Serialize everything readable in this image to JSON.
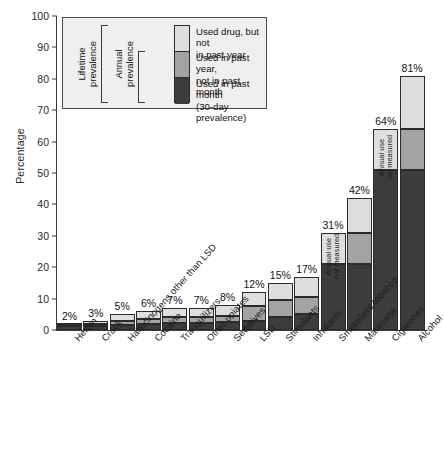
{
  "chart_data": {
    "type": "bar",
    "stacked": true,
    "title": "",
    "xlabel": "",
    "ylabel": "Percentage",
    "ylim": [
      0,
      100
    ],
    "yticks": [
      0,
      10,
      20,
      30,
      40,
      50,
      60,
      70,
      80,
      90,
      100
    ],
    "grid": false,
    "legend_position": "top-left inside plot area",
    "categories": [
      "Heroin",
      "Crack",
      "Hallucinogens other than LSD",
      "Cocaine",
      "Tranquilizers",
      "Other opiates",
      "Sedatives",
      "LSD",
      "Stimulants",
      "Inhalants",
      "Smokeless tobacco",
      "Marijuana",
      "Cigarettes",
      "Alcohol"
    ],
    "series": [
      {
        "name": "Used in past month (30-day prevalence)",
        "color": "#3c3c3c",
        "values": [
          1.4,
          1.2,
          1.5,
          2.0,
          2.2,
          2.2,
          2.4,
          3.0,
          4.0,
          5.0,
          21.0,
          21.0,
          51.0,
          51.0
        ]
      },
      {
        "name": "Used in past year, not in past month",
        "color": "#a3a3a3",
        "values": [
          0.3,
          0.6,
          1.3,
          1.6,
          2.0,
          2.0,
          2.1,
          4.5,
          5.5,
          5.5,
          null,
          10.0,
          null,
          13.0
        ]
      },
      {
        "name": "Used drug, but not in past year",
        "color": "#dedede",
        "values": [
          0.3,
          1.2,
          2.2,
          2.4,
          2.8,
          2.8,
          3.5,
          4.5,
          5.5,
          6.5,
          10.0,
          11.0,
          13.0,
          17.0
        ]
      }
    ],
    "totals": [
      2,
      3,
      5,
      6,
      7,
      7,
      8,
      12,
      15,
      17,
      31,
      42,
      64,
      81
    ],
    "data_labels": [
      "2%",
      "3%",
      "5%",
      "6%",
      "7%",
      "7%",
      "8%",
      "12%",
      "15%",
      "17%",
      "31%",
      "42%",
      "64%",
      "81%"
    ],
    "annotations": [
      {
        "category": "Smokeless tobacco",
        "text": "Annual use not measured"
      },
      {
        "category": "Cigarettes",
        "text": "Annual use not measured"
      }
    ]
  },
  "axis": {
    "y_title": "Percentage",
    "y_ticks": [
      "100",
      "90",
      "80",
      "70",
      "60",
      "50",
      "40",
      "30",
      "20",
      "10",
      "0"
    ]
  },
  "legend": {
    "items": [
      {
        "key": "lifetime-only",
        "label_line1": "Used drug, but not",
        "label_line2": "in past year",
        "color": "#dedede"
      },
      {
        "key": "annual-not-month",
        "label_line1": "Used in past year,",
        "label_line2": "not in past month",
        "color": "#a3a3a3"
      },
      {
        "key": "past-month",
        "label_line1": "Used in past month",
        "label_line2": "(30-day prevalence)",
        "color": "#3c3c3c"
      }
    ],
    "brackets": [
      {
        "key": "lifetime",
        "line1": "Lifetime",
        "line2": "prevalence"
      },
      {
        "key": "annual",
        "line1": "Annual",
        "line2": "prevalence"
      }
    ]
  },
  "bars": [
    {
      "label": "Heroin",
      "value_label": "2%",
      "note": ""
    },
    {
      "label": "Crack",
      "value_label": "3%",
      "note": ""
    },
    {
      "label": "Hallucinogens other than LSD",
      "value_label": "5%",
      "note": ""
    },
    {
      "label": "Cocaine",
      "value_label": "6%",
      "note": ""
    },
    {
      "label": "Tranquilizers",
      "value_label": "7%",
      "note": ""
    },
    {
      "label": "Other opiates",
      "value_label": "7%",
      "note": ""
    },
    {
      "label": "Sedatives",
      "value_label": "8%",
      "note": ""
    },
    {
      "label": "LSD",
      "value_label": "12%",
      "note": ""
    },
    {
      "label": "Stimulants",
      "value_label": "15%",
      "note": ""
    },
    {
      "label": "Inhalants",
      "value_label": "17%",
      "note": ""
    },
    {
      "label": "Smokeless tobacco",
      "value_label": "31%",
      "note": "Annual use\nnot measured"
    },
    {
      "label": "Marijuana",
      "value_label": "42%",
      "note": ""
    },
    {
      "label": "Cigarettes",
      "value_label": "64%",
      "note": "Annual use\nnot measured"
    },
    {
      "label": "Alcohol",
      "value_label": "81%",
      "note": ""
    }
  ]
}
